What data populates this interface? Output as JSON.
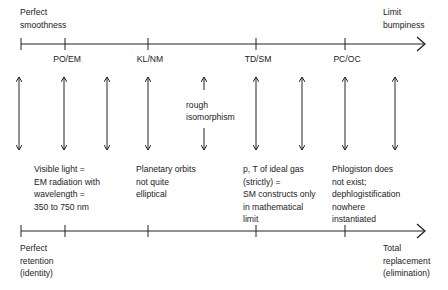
{
  "top_axis": {
    "left_label": "Perfect\nsmoothness",
    "right_label": "Limit\nbumpiness",
    "ticks": [
      {
        "x": 21,
        "label": ""
      },
      {
        "x": 65,
        "label": "PO/EM"
      },
      {
        "x": 148,
        "label": "KL/NM"
      },
      {
        "x": 256,
        "label": "TD/SM"
      },
      {
        "x": 345,
        "label": "PC/OC"
      }
    ]
  },
  "bottom_axis": {
    "left_label": "Perfect\nretention\n(identity)",
    "right_label": "Total\nreplacement\n(elimination)",
    "ticks": [
      21,
      65,
      148,
      256,
      345
    ]
  },
  "arrows": {
    "x_positions": [
      19,
      64,
      107,
      148,
      204,
      256,
      302,
      345,
      395
    ],
    "middle_label": "rough\nisomorphism"
  },
  "examples": [
    {
      "id": "po-em",
      "text": "Visible light =\nEM radiation with\nwavelength =\n350 to 750 nm"
    },
    {
      "id": "kl-nm",
      "text": "Planetary orbits\nnot quite\nelliptical"
    },
    {
      "id": "td-sm",
      "text": "p, T of ideal gas\n(strictly) =\nSM constructs only\nin mathematical\nlimit"
    },
    {
      "id": "pc-oc",
      "text": "Phlogiston does\nnot exist;\ndephlogistification\nnowhere\ninstantiated"
    }
  ],
  "colors": {
    "line": "#222222"
  }
}
